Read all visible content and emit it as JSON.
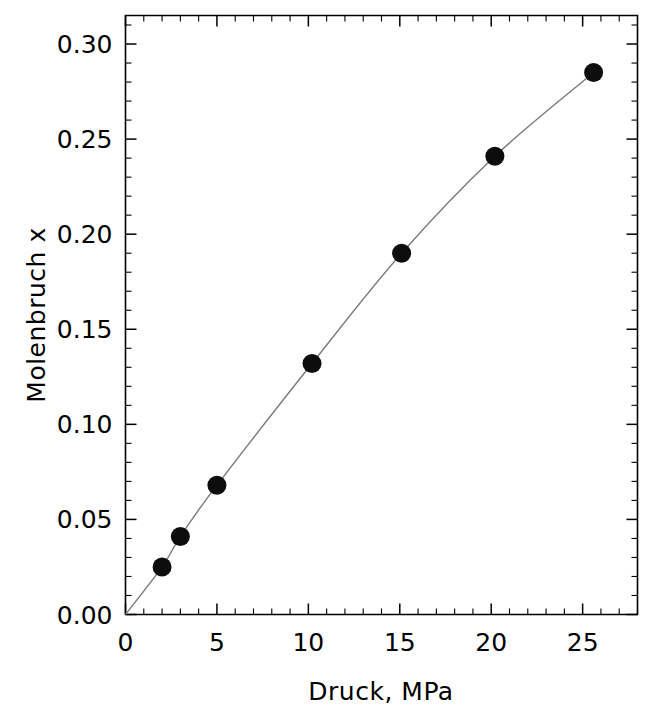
{
  "chart_data": {
    "type": "scatter",
    "title": "",
    "xlabel": "Druck,  MPa",
    "ylabel": "Molenbruch  x",
    "xlim": [
      0,
      28
    ],
    "ylim": [
      0.0,
      0.315
    ],
    "grid": false,
    "legend": null,
    "x_ticks": [
      0,
      5,
      10,
      15,
      20,
      25
    ],
    "x_tick_labels": [
      "0",
      "5",
      "10",
      "15",
      "20",
      "25"
    ],
    "x_minor_step": 1,
    "y_ticks": [
      0.0,
      0.05,
      0.1,
      0.15,
      0.2,
      0.25,
      0.3
    ],
    "y_tick_labels": [
      "0.00",
      "0.05",
      "0.10",
      "0.15",
      "0.20",
      "0.25",
      "0.30"
    ],
    "y_minor_step": 0.01,
    "series": [
      {
        "name": "Molenbruch x",
        "marker": "filled-circle",
        "marker_color": "#0d0d0d",
        "line_color": "#7a7a7a",
        "x": [
          2.0,
          3.0,
          5.0,
          10.2,
          15.1,
          20.2,
          25.6
        ],
        "values": [
          0.025,
          0.041,
          0.068,
          0.132,
          0.19,
          0.241,
          0.285
        ]
      }
    ],
    "curve_origin": [
      0.0,
      0.0
    ],
    "annotations": []
  },
  "figure": {
    "x_axis_title": "Druck,  MPa",
    "y_axis_title": "Molenbruch  x",
    "x_tick_labels": [
      "0",
      "5",
      "10",
      "15",
      "20",
      "25"
    ],
    "y_tick_labels": [
      "0.00",
      "0.05",
      "0.10",
      "0.15",
      "0.20",
      "0.25",
      "0.30"
    ],
    "colors": {
      "background": "#ffffff",
      "axis": "#000000",
      "marker": "#0d0d0d",
      "curve": "#7a7a7a"
    }
  }
}
